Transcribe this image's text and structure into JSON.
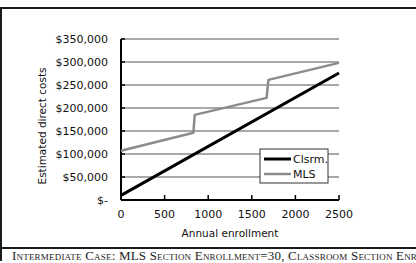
{
  "chart_data": {
    "type": "line",
    "title": "",
    "xlabel": "Annual enrollment",
    "ylabel": "Estimated direct costs",
    "xlim": [
      0,
      2500
    ],
    "ylim": [
      0,
      350000
    ],
    "x_ticks": [
      0,
      500,
      1000,
      1500,
      2000,
      2500
    ],
    "x_tick_labels": [
      "0",
      "500",
      "1000",
      "1500",
      "2000",
      "2500"
    ],
    "y_ticks": [
      0,
      50000,
      100000,
      150000,
      200000,
      250000,
      300000,
      350000
    ],
    "y_tick_labels": [
      "$-",
      "$50,000",
      "$100,000",
      "$150,000",
      "$200,000",
      "$250,000",
      "$300,000",
      "$350,000"
    ],
    "grid": "horizontal",
    "legend_position": "lower right, inside plot",
    "series": [
      {
        "name": "Clsrm.",
        "color": "#000000",
        "line_width": 3,
        "x": [
          0,
          2500
        ],
        "y": [
          10000,
          276000
        ]
      },
      {
        "name": "MLS",
        "color": "#8c8c8c",
        "line_width": 2.5,
        "x": [
          0,
          830,
          845,
          1670,
          1690,
          2500
        ],
        "y": [
          107000,
          146000,
          185000,
          222000,
          261000,
          298000
        ]
      }
    ]
  },
  "caption": {
    "text": "Intermediate Case: MLS Section Enrollment=30, Classroom Section Enroll-"
  }
}
